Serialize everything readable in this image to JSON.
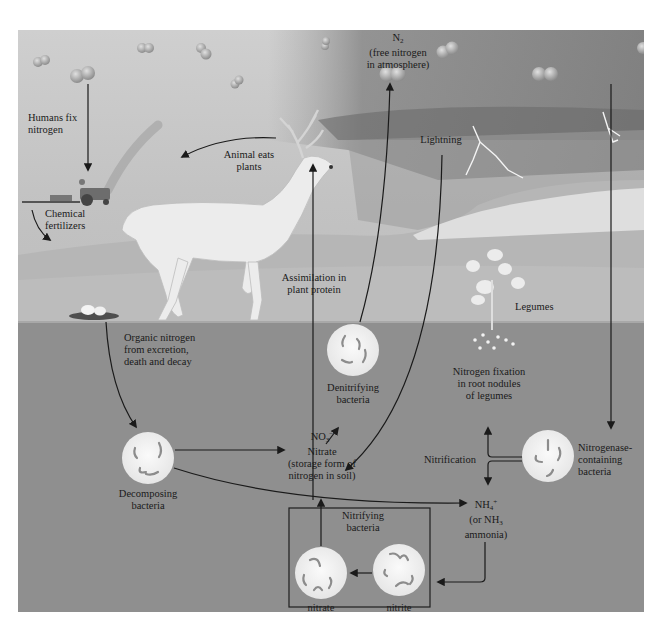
{
  "diagram": {
    "colors": {
      "sky": "#c8c8c8",
      "storm": "#7a7a7a",
      "soil": "#8f8f8f",
      "bacteria_disc": "#f2f2f2",
      "arrow": "#1a1a1a"
    },
    "labels": {
      "n2_formula": "N",
      "n2_sub": "2",
      "n2_line1": "(free nitrogen",
      "n2_line2": "in atmosphere)",
      "humans_fix_1": "Humans fix",
      "humans_fix_2": "nitrogen",
      "chemical_1": "Chemical",
      "chemical_2": "fertilizers",
      "animal_eats_1": "Animal eats",
      "animal_eats_2": "plants",
      "lightning": "Lightning",
      "assimilation_1": "Assimilation in",
      "assimilation_2": "plant protein",
      "legumes": "Legumes",
      "organic_1": "Organic nitrogen",
      "organic_2": "from excretion,",
      "organic_3": "death and decay",
      "denitrifying_1": "Denitrifying",
      "denitrifying_2": "bacteria",
      "nitrogen_fixation_1": "Nitrogen fixation",
      "nitrogen_fixation_2": "in root nodules",
      "nitrogen_fixation_3": "of legumes",
      "nitrogenase_1": "Nitrogenase-",
      "nitrogenase_2": "containing",
      "nitrogenase_3": "bacteria",
      "nitrification": "Nitrification",
      "no3_formula": "NO",
      "no3_sub": "3",
      "no3_sup": "−",
      "nitrate_1": "Nitrate",
      "nitrate_2": "(storage form of",
      "nitrate_3": "nitrogen in soil)",
      "decomposing_1": "Decomposing",
      "decomposing_2": "bacteria",
      "nh4_formula": "NH",
      "nh4_sub": "4",
      "nh4_sup": "+",
      "nh3_prefix": "(or NH",
      "nh3_sub": "3",
      "ammonia": "ammonia)",
      "nitrifying_1": "Nitrifying",
      "nitrifying_2": "bacteria",
      "nitrate_bact_1": "nitrate",
      "nitrate_bact_2": "bacteria",
      "nitrite_bact_1": "nitrite",
      "nitrite_bact_2": "bacteria"
    },
    "icons": [
      "n2-molecule-icon",
      "tractor-icon",
      "deer-icon",
      "lightning-icon",
      "legume-plant-icon",
      "mushroom-icon",
      "bacteria-icon"
    ]
  }
}
